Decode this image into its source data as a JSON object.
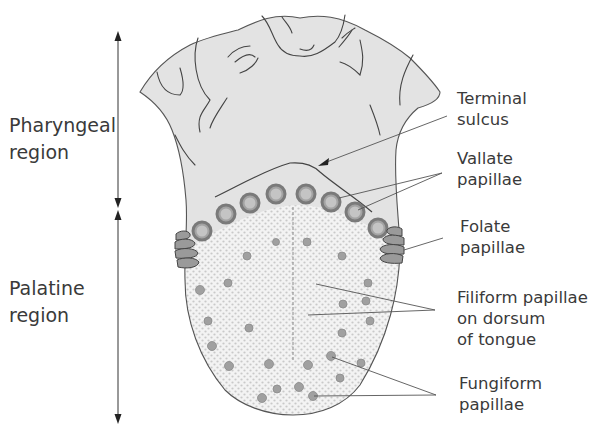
{
  "diagram": {
    "colors": {
      "background": "#ffffff",
      "pharyngeal_fill": "#e2e2e2",
      "palatine_fill": "#f1f1f1",
      "dot_pattern": "#c8c8c8",
      "papilla_fill": "#9a9a9a",
      "papilla_ring": "#7f7f7f",
      "outline": "#555555",
      "text": "#3a3a3a"
    },
    "regions": [
      {
        "id": "pharyngeal",
        "line1": "Pharyngeal",
        "line2": "region"
      },
      {
        "id": "palatine",
        "line1": "Palatine",
        "line2": "region"
      }
    ],
    "callouts": [
      {
        "id": "terminal-sulcus",
        "line1": "Terminal",
        "line2": "sulcus"
      },
      {
        "id": "vallate-papillae",
        "line1": "Vallate",
        "line2": "papillae"
      },
      {
        "id": "folate-papillae",
        "line1": "Folate",
        "line2": "papillae"
      },
      {
        "id": "filiform-papillae",
        "line1": "Filiform papillae",
        "line2": "on dorsum",
        "line3": "of tongue"
      },
      {
        "id": "fungiform-papillae",
        "line1": "Fungiform",
        "line2": "papillae"
      }
    ]
  }
}
